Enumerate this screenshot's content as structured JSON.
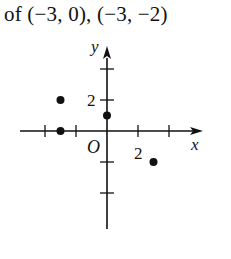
{
  "caption": "of (−3, 0), (−3, −2)",
  "chart_data": {
    "type": "scatter",
    "title": "",
    "xlabel": "x",
    "ylabel": "y",
    "origin_label": "O",
    "xlim": [
      -6.5,
      6
    ],
    "ylim": [
      -6.5,
      5
    ],
    "tick_step": 2,
    "x_ticks": [
      -4,
      -2,
      2,
      4
    ],
    "y_ticks": [
      -4,
      -2,
      2,
      4
    ],
    "x_tick_labels": [
      {
        "value": 2,
        "label": "2"
      }
    ],
    "y_tick_labels": [
      {
        "value": 2,
        "label": "2"
      }
    ],
    "grid": false,
    "points": [
      {
        "x": -3,
        "y": 0
      },
      {
        "x": -3,
        "y": 2
      },
      {
        "x": 0,
        "y": 1
      },
      {
        "x": 3,
        "y": -2
      }
    ],
    "colors": {
      "axis": "#111111",
      "point": "#111111"
    }
  }
}
